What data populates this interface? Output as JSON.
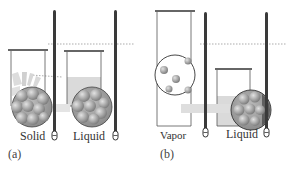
{
  "panels": [
    {
      "id": "a",
      "panel_label": "(a)",
      "left_label": "Solid",
      "right_label": "Liquid"
    },
    {
      "id": "b",
      "panel_label": "(b)",
      "left_label": "Vapor",
      "right_label": "Liquid"
    }
  ],
  "colors": {
    "thermometer": "#3a3a3a",
    "beaker_outline": "#555555",
    "liquid_fill": "#d9d9d9",
    "sphere_fill": "#9a9a9a",
    "sphere_light": "#c8c8c8",
    "dotted_line": "#888888"
  }
}
